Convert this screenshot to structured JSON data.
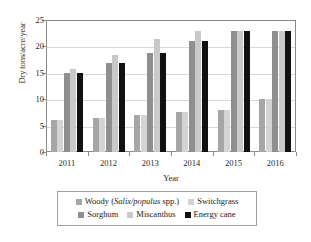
{
  "chart_data": {
    "type": "bar",
    "title": "",
    "xlabel": "Year",
    "ylabel": "Dry tons/acre/year",
    "categories": [
      "2011",
      "2012",
      "2013",
      "2014",
      "2015",
      "2016"
    ],
    "ylim": [
      0,
      25
    ],
    "yticks": [
      "0",
      "5",
      "10",
      "15",
      "20",
      "25"
    ],
    "ytick_values": [
      0,
      5,
      10,
      15,
      20,
      25
    ],
    "grid": "horizontal",
    "legend_position": "bottom",
    "series": [
      {
        "name": "Woody (Salix/populus spp.)",
        "color": "#a6a6a6",
        "values": [
          6.0,
          6.5,
          7.0,
          7.5,
          8.0,
          10.0
        ]
      },
      {
        "name": "Switchgrass",
        "color": "#d4d4d4",
        "values": [
          6.0,
          6.5,
          7.0,
          7.5,
          8.0,
          10.0
        ]
      },
      {
        "name": "Sorghum",
        "color": "#8f8f8f",
        "values": [
          15.0,
          16.8,
          18.7,
          21.0,
          23.0,
          23.0
        ]
      },
      {
        "name": "Miscanthus",
        "color": "#c9c9c9",
        "values": [
          15.7,
          18.4,
          21.4,
          22.9,
          23.0,
          23.0
        ]
      },
      {
        "name": "Energy cane",
        "color": "#111111",
        "values": [
          15.0,
          16.8,
          18.7,
          21.0,
          23.0,
          23.0
        ]
      }
    ]
  },
  "legend": {
    "rows": [
      [
        {
          "label_html": "Woody (<i>Salix/populus</i> spp.)",
          "label": "Woody (Salix/populus spp.)",
          "color": "#a6a6a6"
        },
        {
          "label_html": "Switchgrass",
          "label": "Switchgrass",
          "color": "#d4d4d4"
        }
      ],
      [
        {
          "label_html": "Sorghum",
          "label": "Sorghum",
          "color": "#8f8f8f"
        },
        {
          "label_html": "Miscanthus",
          "label": "Miscanthus",
          "color": "#c9c9c9"
        },
        {
          "label_html": "Energy cane",
          "label": "Energy cane",
          "color": "#111111"
        }
      ]
    ]
  },
  "colors": {
    "axis": "#8c8c8c",
    "grid": "#d9d9d9",
    "text": "#1a1a1a",
    "background": "#ffffff"
  }
}
